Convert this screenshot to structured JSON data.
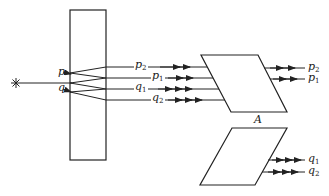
{
  "diagram": {
    "type": "optics-ray-diagram",
    "source": {
      "icon": "light-source-star-icon"
    },
    "plate": {
      "label": ""
    },
    "entry_points": [
      {
        "label": "p"
      },
      {
        "label": "q"
      }
    ],
    "rays_between": [
      {
        "base": "p",
        "sub": "2"
      },
      {
        "base": "p",
        "sub": "1"
      },
      {
        "base": "q",
        "sub": "1"
      },
      {
        "base": "q",
        "sub": "2"
      }
    ],
    "prism_upper": {
      "label": "A",
      "outputs": [
        {
          "base": "p",
          "sub": "2"
        },
        {
          "base": "p",
          "sub": "1"
        }
      ]
    },
    "prism_lower": {
      "label": "",
      "outputs": [
        {
          "base": "q",
          "sub": "1"
        },
        {
          "base": "q",
          "sub": "2"
        }
      ]
    },
    "line_color": "#222222"
  }
}
